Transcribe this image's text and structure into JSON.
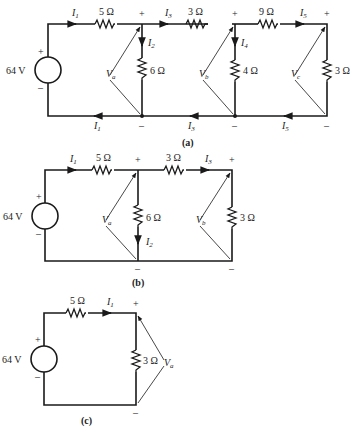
{
  "figure": {
    "source_voltage": "64 V",
    "plus": "+",
    "minus": "–",
    "circuits": [
      {
        "caption": "(a)",
        "resistors": {
          "r_series1": "5 Ω",
          "r_shunt1": "6 Ω",
          "r_series2": "3 Ω",
          "r_shunt2": "4 Ω",
          "r_series3": "9 Ω",
          "r_load": "3 Ω"
        },
        "currents": {
          "top": [
            "I1",
            "I3",
            "I5"
          ],
          "branch": [
            "I2",
            "I4"
          ],
          "bottom": [
            "I1",
            "I3",
            "I5"
          ]
        },
        "voltages": [
          "Va",
          "Vb",
          "Vc"
        ]
      },
      {
        "caption": "(b)",
        "resistors": {
          "r_series1": "5 Ω",
          "r_shunt1": "6 Ω",
          "r_series2": "3 Ω",
          "r_load": "3 Ω"
        },
        "currents": {
          "top": [
            "I1",
            "I3"
          ],
          "branch": [
            "I2"
          ]
        },
        "voltages": [
          "Va",
          "Vb"
        ]
      },
      {
        "caption": "(c)",
        "resistors": {
          "r_series1": "5 Ω",
          "r_load": "3 Ω"
        },
        "currents": {
          "top": [
            "I1"
          ]
        },
        "voltages": [
          "Va"
        ]
      }
    ]
  }
}
